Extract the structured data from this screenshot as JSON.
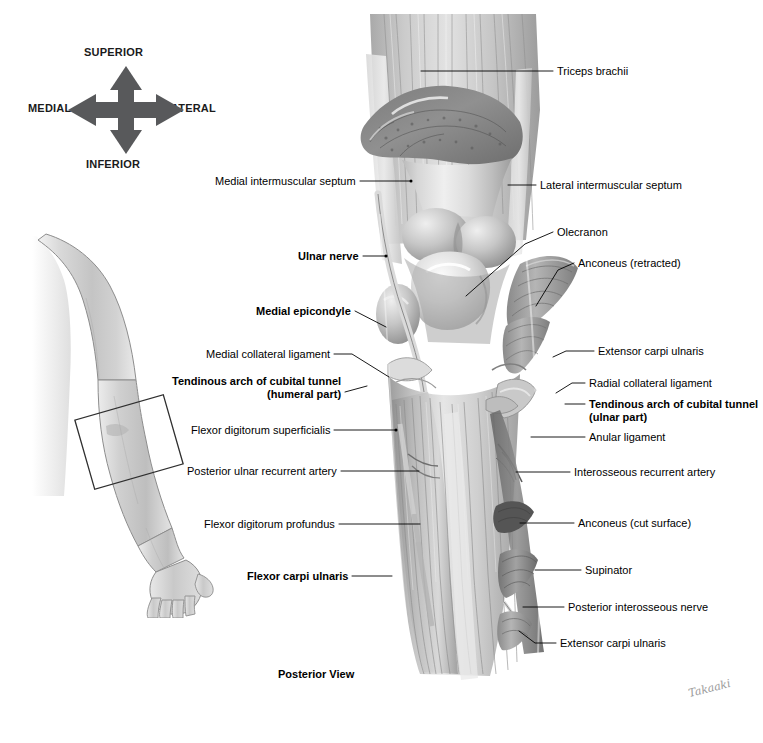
{
  "figure": {
    "view_caption": "Posterior View",
    "signature": "Takaaki",
    "background_color": "#ffffff",
    "ink_color": "#000000"
  },
  "compass": {
    "name": "anatomical-orientation-compass",
    "superior": "SUPERIOR",
    "inferior": "INFERIOR",
    "medial": "MEDIAL",
    "lateral": "LATERAL",
    "arrow_color": "#58595b"
  },
  "arm_inset": {
    "name": "arm-orientation-inset",
    "description": "grayscale right upper limb, posterior aspect, with region-of-interest rectangle over the elbow",
    "skin_color": "#d6d6d6",
    "outline_color": "#7a7a7a",
    "roi_box_color": "#333333"
  },
  "labels_left": [
    {
      "id": "medial-intermuscular-septum",
      "text": "Medial intermuscular septum",
      "bold": false,
      "lines": [
        "Medial intermuscular septum"
      ],
      "x": 231,
      "y": 175,
      "leader": [
        [
          360,
          181
        ],
        [
          411,
          181
        ]
      ]
    },
    {
      "id": "ulnar-nerve",
      "text": "Ulnar nerve",
      "bold": true,
      "lines": [
        "Ulnar nerve"
      ],
      "x": 303,
      "y": 250,
      "leader": [
        [
          363,
          256
        ],
        [
          386,
          256
        ]
      ]
    },
    {
      "id": "medial-epicondyle",
      "text": "Medial epicondyle",
      "bold": true,
      "lines": [
        "Medial epicondyle"
      ],
      "x": 264,
      "y": 305,
      "leader": [
        [
          355,
          311
        ],
        [
          386,
          327
        ]
      ]
    },
    {
      "id": "medial-collateral-ligament",
      "text": "Medial collateral ligament",
      "bold": false,
      "lines": [
        "Medial collateral ligament"
      ],
      "x": 231,
      "y": 348,
      "leader": [
        [
          334,
          354
        ],
        [
          350,
          354
        ],
        [
          388,
          377
        ]
      ]
    },
    {
      "id": "tendinous-arch-cubital-tunnel-humeral",
      "text": "Tendinous arch of cubital tunnel (humeral part)",
      "bold": true,
      "lines": [
        "Tendinous arch of cubital tunnel",
        "(humeral part)"
      ],
      "x": 190,
      "y": 375,
      "leader": [
        [
          345,
          392
        ],
        [
          366,
          386
        ]
      ]
    },
    {
      "id": "flexor-digitorum-superficialis",
      "text": "Flexor digitorum superficialis",
      "bold": false,
      "lines": [
        "Flexor digitorum superficialis"
      ],
      "x": 216,
      "y": 424,
      "leader": [
        [
          334,
          430
        ],
        [
          396,
          430
        ]
      ]
    },
    {
      "id": "posterior-ulnar-recurrent-artery",
      "text": "Posterior ulnar recurrent artery",
      "bold": false,
      "lines": [
        "Posterior ulnar recurrent artery"
      ],
      "x": 207,
      "y": 465,
      "leader": [
        [
          341,
          471
        ],
        [
          419,
          471
        ]
      ]
    },
    {
      "id": "flexor-digitorum-profundus",
      "text": "Flexor digitorum profundus",
      "bold": false,
      "lines": [
        "Flexor digitorum profundus"
      ],
      "x": 229,
      "y": 518,
      "leader": [
        [
          339,
          524
        ],
        [
          420,
          524
        ]
      ]
    },
    {
      "id": "flexor-carpi-ulnaris",
      "text": "Flexor carpi ulnaris",
      "bold": true,
      "lines": [
        "Flexor carpi ulnaris"
      ],
      "x": 260,
      "y": 570,
      "leader": [
        [
          352,
          576
        ],
        [
          392,
          576
        ]
      ]
    }
  ],
  "labels_right": [
    {
      "id": "triceps-brachii",
      "text": "Triceps brachii",
      "bold": false,
      "lines": [
        "Triceps brachii"
      ],
      "x": 557,
      "y": 65,
      "leader": [
        [
          553,
          71
        ],
        [
          421,
          71
        ]
      ]
    },
    {
      "id": "lateral-intermuscular-septum",
      "text": "Lateral intermuscular septum",
      "bold": false,
      "lines": [
        "Lateral intermuscular septum"
      ],
      "x": 540,
      "y": 179,
      "leader": [
        [
          536,
          185
        ],
        [
          508,
          185
        ]
      ]
    },
    {
      "id": "olecranon",
      "text": "Olecranon",
      "bold": false,
      "lines": [
        "Olecranon"
      ],
      "x": 557,
      "y": 226,
      "leader": [
        [
          553,
          232
        ],
        [
          524,
          244
        ],
        [
          466,
          295
        ]
      ]
    },
    {
      "id": "anconeus-retracted",
      "text": "Anconeus (retracted)",
      "bold": false,
      "lines": [
        "Anconeus (retracted)"
      ],
      "x": 578,
      "y": 257,
      "leader": [
        [
          574,
          263
        ],
        [
          558,
          270
        ],
        [
          536,
          305
        ]
      ]
    },
    {
      "id": "extensor-carpi-ulnaris-upper",
      "text": "Extensor carpi ulnaris",
      "bold": false,
      "lines": [
        "Extensor carpi ulnaris"
      ],
      "x": 598,
      "y": 345,
      "leader": [
        [
          594,
          351
        ],
        [
          565,
          351
        ],
        [
          554,
          356
        ]
      ]
    },
    {
      "id": "radial-collateral-ligament",
      "text": "Radial collateral ligament",
      "bold": false,
      "lines": [
        "Radial collateral ligament"
      ],
      "x": 589,
      "y": 377,
      "leader": [
        [
          585,
          383
        ],
        [
          572,
          383
        ],
        [
          556,
          392
        ]
      ]
    },
    {
      "id": "tendinous-arch-cubital-tunnel-ulnar",
      "text": "Tendinous arch of cubital tunnel (ulnar part)",
      "bold": true,
      "lines": [
        "Tendinous arch of cubital tunnel",
        "(ulnar part)"
      ],
      "x": 589,
      "y": 398,
      "leader": [
        [
          585,
          404
        ],
        [
          565,
          404
        ]
      ]
    },
    {
      "id": "anular-ligament",
      "text": "Anular ligament",
      "bold": false,
      "lines": [
        "Anular ligament"
      ],
      "x": 589,
      "y": 431,
      "leader": [
        [
          585,
          437
        ],
        [
          531,
          437
        ]
      ]
    },
    {
      "id": "interosseous-recurrent-artery",
      "text": "Interosseous recurrent artery",
      "bold": false,
      "lines": [
        "Interosseous recurrent artery"
      ],
      "x": 574,
      "y": 466,
      "leader": [
        [
          570,
          472
        ],
        [
          516,
          472
        ]
      ]
    },
    {
      "id": "anconeus-cut-surface",
      "text": "Anconeus (cut surface)",
      "bold": false,
      "lines": [
        "Anconeus (cut surface)"
      ],
      "x": 578,
      "y": 517,
      "leader": [
        [
          574,
          523
        ],
        [
          520,
          523
        ]
      ]
    },
    {
      "id": "supinator",
      "text": "Supinator",
      "bold": false,
      "lines": [
        "Supinator"
      ],
      "x": 585,
      "y": 564,
      "leader": [
        [
          581,
          570
        ],
        [
          535,
          570
        ]
      ]
    },
    {
      "id": "posterior-interosseous-nerve",
      "text": "Posterior interosseous nerve",
      "bold": false,
      "lines": [
        "Posterior interosseous nerve"
      ],
      "x": 568,
      "y": 601,
      "leader": [
        [
          564,
          607
        ],
        [
          523,
          607
        ]
      ]
    },
    {
      "id": "extensor-carpi-ulnaris-lower",
      "text": "Extensor carpi ulnaris",
      "bold": false,
      "lines": [
        "Extensor carpi ulnaris"
      ],
      "x": 560,
      "y": 637,
      "leader": [
        [
          556,
          643
        ],
        [
          534,
          643
        ],
        [
          519,
          630
        ]
      ]
    }
  ]
}
